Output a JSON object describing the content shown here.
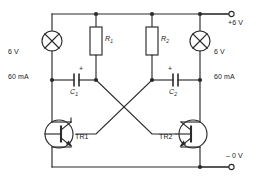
{
  "diagram": {
    "stroke_color": "#2b2b2b",
    "background_color": "#ffffff"
  },
  "rails": {
    "positive": {
      "label": "+6 V",
      "terminal_name": "positive-supply-terminal"
    },
    "negative": {
      "label": "– 0 V",
      "terminal_name": "negative-supply-terminal"
    }
  },
  "lamps": [
    {
      "id": "lamp-left",
      "voltage": "6 V",
      "current": "60 mA",
      "label_line1": "6 V",
      "label_line2": "60 mA"
    },
    {
      "id": "lamp-right",
      "voltage": "6 V",
      "current": "60 mA",
      "label_line1": "6 V",
      "label_line2": "60 mA"
    }
  ],
  "resistors": [
    {
      "id": "resistor-r1",
      "label": "R",
      "subscript": "1"
    },
    {
      "id": "resistor-r2",
      "label": "R",
      "subscript": "2"
    }
  ],
  "capacitors": [
    {
      "id": "capacitor-c1",
      "label": "C",
      "subscript": "1",
      "polarity": "+"
    },
    {
      "id": "capacitor-c2",
      "label": "C",
      "subscript": "2",
      "polarity": "+"
    }
  ],
  "transistors": [
    {
      "id": "transistor-tr1",
      "label": "TR1",
      "type": "npn"
    },
    {
      "id": "transistor-tr2",
      "label": "TR2",
      "type": "npn"
    }
  ]
}
